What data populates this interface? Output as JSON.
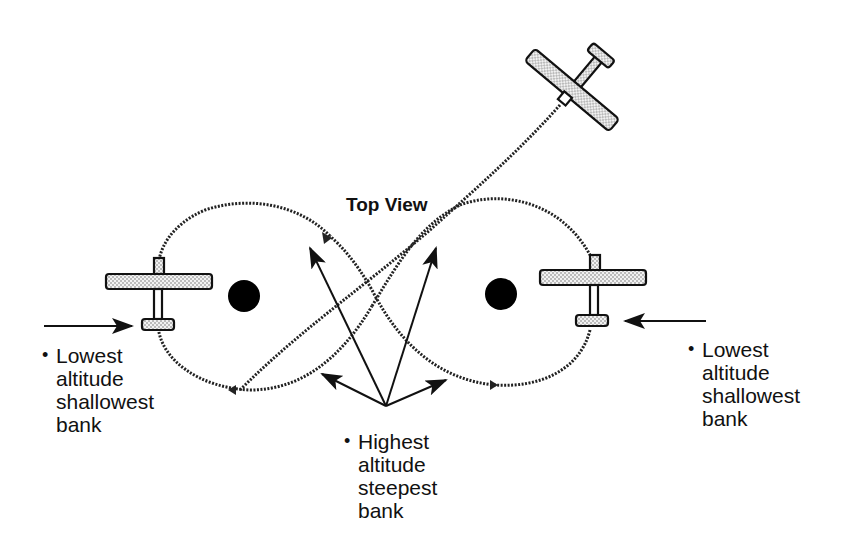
{
  "title": "Top View",
  "labels": {
    "left": {
      "bullet": "•",
      "lines": [
        "Lowest",
        "altitude",
        "shallowest",
        "bank"
      ]
    },
    "center": {
      "bullet": "•",
      "lines": [
        "Highest",
        "altitude",
        "steepest",
        "bank"
      ]
    },
    "right": {
      "bullet": "•",
      "lines": [
        "Lowest",
        "altitude",
        "shallowest",
        "bank"
      ]
    }
  },
  "colors": {
    "ink": "#111111",
    "wing_fill": "#d9d9d9",
    "background": "#ffffff"
  },
  "icons": [
    "airplane-icon",
    "pylon-marker-icon",
    "arrow-icon"
  ]
}
